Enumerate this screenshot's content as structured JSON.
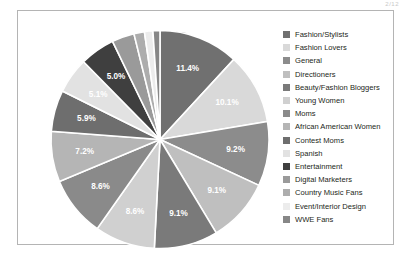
{
  "figure": {
    "corner_artifact_text": "2/12",
    "background_color": "#ffffff",
    "frame_color": "#b4b4b4"
  },
  "chart_data": {
    "type": "pie",
    "title": "",
    "xlabel": "",
    "ylabel": "",
    "legend_position": "right",
    "grid": false,
    "label_format": "percent",
    "start_angle_deg": 0,
    "direction": "clockwise",
    "categories": [
      "Fashion/Stylists",
      "Fashion Lovers",
      "General",
      "Directioners",
      "Beauty/Fashion Bloggers",
      "Young Women",
      "Moms",
      "African American Women",
      "Contest Moms",
      "Spanish",
      "Entertainment",
      "Digital Marketers",
      "Country Music Fans",
      "Event/Interior Design",
      "WWE Fans"
    ],
    "values": [
      11.4,
      10.1,
      9.2,
      9.1,
      9.1,
      8.6,
      8.6,
      7.2,
      5.9,
      5.1,
      5.0,
      3.2,
      1.5,
      1.2,
      1.0
    ],
    "labels": [
      "11.4%",
      "10.1%",
      "9.2%",
      "9.1%",
      "9.1%",
      "8.6%",
      "8.6%",
      "7.2%",
      "5.9%",
      "5.1%",
      "5.0%",
      "",
      "",
      "",
      ""
    ],
    "colors": [
      "#707070",
      "#d9d9d9",
      "#8c8c8c",
      "#bfbfbf",
      "#7a7a7a",
      "#d0d0d0",
      "#8a8a8a",
      "#b5b5b5",
      "#6e6e6e",
      "#e2e2e2",
      "#3f3f3f",
      "#9a9a9a",
      "#adadad",
      "#ececec",
      "#878787"
    ]
  },
  "legend": {
    "items": [
      {
        "label": "Fashion/Stylists",
        "color": "#707070"
      },
      {
        "label": "Fashion Lovers",
        "color": "#d9d9d9"
      },
      {
        "label": "General",
        "color": "#8c8c8c"
      },
      {
        "label": "Directioners",
        "color": "#bfbfbf"
      },
      {
        "label": "Beauty/Fashion Bloggers",
        "color": "#7a7a7a"
      },
      {
        "label": "Young Women",
        "color": "#d0d0d0"
      },
      {
        "label": "Moms",
        "color": "#8a8a8a"
      },
      {
        "label": "African American Women",
        "color": "#b5b5b5"
      },
      {
        "label": "Contest Moms",
        "color": "#6e6e6e"
      },
      {
        "label": "Spanish",
        "color": "#e2e2e2"
      },
      {
        "label": "Entertainment",
        "color": "#3f3f3f"
      },
      {
        "label": "Digital Marketers",
        "color": "#9a9a9a"
      },
      {
        "label": "Country Music Fans",
        "color": "#adadad"
      },
      {
        "label": "Event/Interior Design",
        "color": "#ececec"
      },
      {
        "label": "WWE Fans",
        "color": "#878787"
      }
    ]
  }
}
